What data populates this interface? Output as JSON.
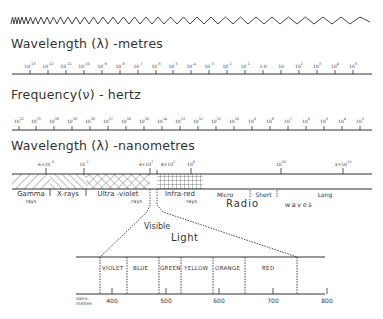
{
  "wave": {
    "description": "sinusoidal wave with increasing wavelength from left to right"
  },
  "section_metres": {
    "title": "Wavelength (λ) -metres",
    "ticks": [
      {
        "base": "10",
        "exp": "-13"
      },
      {
        "base": "10",
        "exp": "-12"
      },
      {
        "base": "10",
        "exp": "-11"
      },
      {
        "base": "10",
        "exp": "-10"
      },
      {
        "base": "10",
        "exp": "-9"
      },
      {
        "base": "10",
        "exp": "-8"
      },
      {
        "base": "10",
        "exp": "-7"
      },
      {
        "base": "10",
        "exp": "-6"
      },
      {
        "base": "10",
        "exp": "-5"
      },
      {
        "base": "10",
        "exp": "-4"
      },
      {
        "base": "10",
        "exp": "-3"
      },
      {
        "base": "10",
        "exp": "-2"
      },
      {
        "base": "10",
        "exp": "-1"
      },
      {
        "base": "1·0",
        "exp": ""
      },
      {
        "base": "10",
        "exp": ""
      },
      {
        "base": "10",
        "exp": "2"
      },
      {
        "base": "10",
        "exp": "3"
      },
      {
        "base": "10",
        "exp": "4"
      },
      {
        "base": "10",
        "exp": "5"
      }
    ]
  },
  "section_frequency": {
    "title": "Frequency(ν) - hertz",
    "ticks": [
      {
        "base": "10",
        "exp": "22"
      },
      {
        "base": "10",
        "exp": "21"
      },
      {
        "base": "10",
        "exp": "20"
      },
      {
        "base": "10",
        "exp": "19"
      },
      {
        "base": "10",
        "exp": "18"
      },
      {
        "base": "10",
        "exp": "17"
      },
      {
        "base": "10",
        "exp": "16"
      },
      {
        "base": "10",
        "exp": "15"
      },
      {
        "base": "10",
        "exp": "14"
      },
      {
        "base": "10",
        "exp": "13"
      },
      {
        "base": "10",
        "exp": "12"
      },
      {
        "base": "10",
        "exp": "11"
      },
      {
        "base": "10",
        "exp": "10"
      },
      {
        "base": "10",
        "exp": "9"
      },
      {
        "base": "10",
        "exp": "8"
      },
      {
        "base": "10",
        "exp": "7"
      },
      {
        "base": "10",
        "exp": "6"
      },
      {
        "base": "10",
        "exp": "5"
      },
      {
        "base": "10",
        "exp": "4"
      },
      {
        "base": "10",
        "exp": "3"
      }
    ]
  },
  "section_nanometres": {
    "title": "Wavelength (λ) -nanometres",
    "ticks": [
      {
        "label": "6×10",
        "exp": "-3",
        "x": 46
      },
      {
        "label": "10",
        "exp": "-1",
        "x": 84
      },
      {
        "label": "4×10",
        "exp": "2",
        "x": 150
      },
      {
        "label": "8×10",
        "exp": "2",
        "x": 157
      },
      {
        "label": "10",
        "exp": "6",
        "x": 191
      },
      {
        "label": "10",
        "exp": "10",
        "x": 281
      },
      {
        "label": "3×10",
        "exp": "13",
        "x": 343
      }
    ],
    "bands": [
      {
        "name": "gamma",
        "label": "Gamma",
        "sub": "rays"
      },
      {
        "name": "x-rays",
        "label": "X-rays",
        "sub": ""
      },
      {
        "name": "ultra-violet",
        "label": "Ultra -violet",
        "sub": "rays"
      },
      {
        "name": "infra-red",
        "label": "Infra-red",
        "sub": "rays"
      },
      {
        "name": "micro",
        "label": "Micro",
        "sub": ""
      },
      {
        "name": "short",
        "label": "Short",
        "sub": ""
      },
      {
        "name": "long",
        "label": "Long",
        "sub": ""
      }
    ],
    "radio_label": "Radio",
    "waves_label": "waves"
  },
  "visible_light": {
    "title_line1": "Visible",
    "title_line2": "Light",
    "colors": [
      "VIOLET",
      "BLUE",
      "GREEN",
      "YELLOW",
      "ORANGE",
      "RED"
    ],
    "axis_unit": "nano-\nmetres",
    "axis_unit_line1": "nano-",
    "axis_unit_line2": "metres",
    "axis_ticks": [
      "400",
      "500",
      "600",
      "700",
      "800"
    ]
  }
}
